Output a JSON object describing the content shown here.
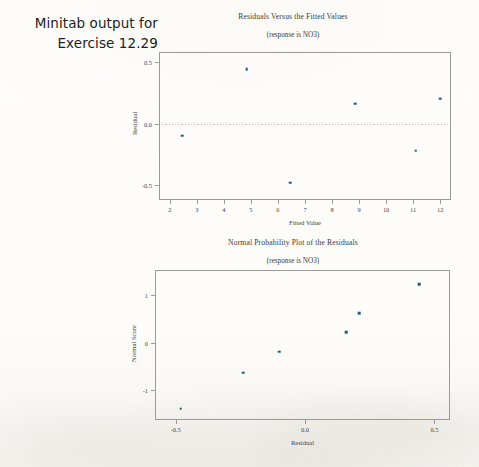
{
  "caption": {
    "line1": "Minitab output for",
    "line2": "Exercise 12.29"
  },
  "colors": {
    "marker": "#1d5f6b",
    "axis": "#9a9a9a",
    "zero_line": "#b8a3a0",
    "paper": "#fdfcfa",
    "text": "#3a3a3a"
  },
  "chart_data": [
    {
      "type": "scatter",
      "title": "Residuals Versus the Fitted Values",
      "subtitle": "(response is NO3)",
      "xlabel": "Fitted Value",
      "ylabel": "Residual",
      "xlim": [
        1.6,
        12.4
      ],
      "ylim": [
        -0.62,
        0.58
      ],
      "xticks": [
        2,
        3,
        4,
        5,
        6,
        7,
        8,
        9,
        10,
        11,
        12
      ],
      "xticklabels": [
        "2",
        "3",
        "4",
        "5",
        "6",
        "7",
        "8",
        "9",
        "10",
        "11",
        "12"
      ],
      "yticks": [
        0.5,
        0.0,
        -0.5
      ],
      "yticklabels": [
        "0.5",
        "0.0",
        "-0.5"
      ],
      "grid": false,
      "legend": "none",
      "reference_line": {
        "y": 0.0,
        "style": "dotted"
      },
      "points": [
        {
          "x": 2.45,
          "y": -0.1
        },
        {
          "x": 4.85,
          "y": 0.44
        },
        {
          "x": 6.45,
          "y": -0.48
        },
        {
          "x": 8.85,
          "y": 0.16
        },
        {
          "x": 11.1,
          "y": -0.22
        },
        {
          "x": 12.0,
          "y": 0.2
        }
      ]
    },
    {
      "type": "scatter",
      "title": "Normal Probability Plot of the Residuals",
      "subtitle": "(response is NO3)",
      "xlabel": "Residual",
      "ylabel": "Normal Score",
      "xlim": [
        -0.58,
        0.56
      ],
      "ylim": [
        -1.62,
        1.52
      ],
      "xticks": [
        -0.5,
        0.0,
        0.5
      ],
      "xticklabels": [
        "-0.5",
        "0.0",
        "0.5"
      ],
      "yticks": [
        1,
        0,
        -1
      ],
      "yticklabels": [
        "1",
        "0",
        "-1"
      ],
      "grid": false,
      "legend": "none",
      "points": [
        {
          "x": -0.48,
          "y": -1.38
        },
        {
          "x": -0.24,
          "y": -0.63
        },
        {
          "x": -0.1,
          "y": -0.19
        },
        {
          "x": 0.16,
          "y": 0.22
        },
        {
          "x": 0.21,
          "y": 0.62
        },
        {
          "x": 0.44,
          "y": 1.22
        }
      ]
    }
  ]
}
